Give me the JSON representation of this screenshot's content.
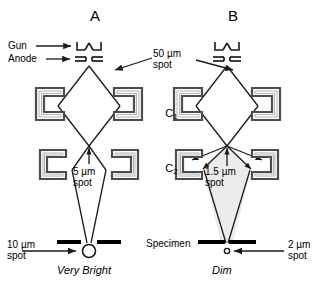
{
  "figure": {
    "type": "diagram",
    "panels": [
      {
        "id": "A",
        "letter": "A",
        "gun_label": "Gun",
        "anode_label": "Anode",
        "gun_glyph": "|_V_|",
        "crossover_spot": "50 µm\nspot",
        "c2_spot_value": "5 µm",
        "c2_spot_unit_label": "spot",
        "specimen_spot_value": "10 µm",
        "specimen_spot_unit_label": "spot",
        "brightness": "Very Bright",
        "beam_shaded": false
      },
      {
        "id": "B",
        "letter": "B",
        "gun_glyph": "|_V_|",
        "crossover_spot": "50 µm\nspot",
        "c2_spot_value": "1.5 µm",
        "c2_spot_unit_label": "spot",
        "specimen_spot_value": "2 µm",
        "specimen_spot_unit_label": "spot",
        "brightness": "Dim",
        "beam_shaded": true
      }
    ],
    "shared_labels": {
      "gun": "Gun",
      "anode": "Anode",
      "crossover_spot_line1": "50 µm",
      "crossover_spot_line2": "spot",
      "lens1": "C",
      "lens1_sub": "1",
      "lens2": "C",
      "lens2_sub": "2",
      "specimen": "Specimen"
    },
    "panel_a": {
      "c2_spot_line1": "5 µm",
      "c2_spot_line2": "spot",
      "specimen_spot_line1": "10 µm",
      "specimen_spot_line2": "spot",
      "brightness": "Very Bright"
    },
    "panel_b": {
      "c2_spot_line1": "1.5 µm",
      "c2_spot_line2": "spot",
      "specimen_spot_line1": "2 µm",
      "specimen_spot_line2": "spot",
      "brightness": "Dim"
    },
    "colors": {
      "ink": "#1a1a1a",
      "lens_fill": "#ffffff",
      "lens_stroke": "#4d4d4d",
      "lens_inner": "#b3b3b3",
      "beam_shade": "#ebebeb",
      "specimen_bar": "#000000",
      "background": "#ffffff"
    }
  }
}
